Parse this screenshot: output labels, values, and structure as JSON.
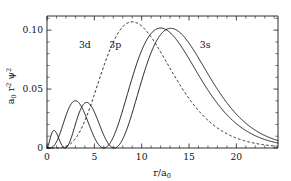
{
  "chart_data": {
    "type": "line",
    "title": "",
    "xlabel": "r/a_0",
    "ylabel": "a_0 r^2 psi^2",
    "xlim": [
      0,
      24.4
    ],
    "ylim": [
      0,
      0.112
    ],
    "grid": false,
    "legend_position": "inline-annotations",
    "x_ticks": [
      0,
      5,
      10,
      15,
      20
    ],
    "x_tick_labels": [
      "0",
      "5",
      "10",
      "15",
      "20"
    ],
    "x_minor_tick_step": 1,
    "y_ticks": [
      0,
      0.05,
      0.1
    ],
    "y_tick_labels": [
      "0",
      "0.05",
      "0.10"
    ],
    "y_minor_tick_step": 0.01,
    "annotations": [
      {
        "text": "3d",
        "x": 4.0,
        "y": 0.0845,
        "style": "dashed-series-label"
      },
      {
        "text": "3p",
        "x": 7.2,
        "y": 0.0845,
        "style": "solid-series-label"
      },
      {
        "text": "3s",
        "x": 16.7,
        "y": 0.0845,
        "style": "solid-series-label"
      }
    ],
    "series": [
      {
        "name": "3s",
        "label": "3s",
        "linestyle": "solid",
        "color": "#111111",
        "nodes_r": [
          1.9,
          7.1
        ],
        "peaks": [
          {
            "r": 0.74,
            "value": 0.0122
          },
          {
            "r": 4.2,
            "value": 0.0385
          },
          {
            "r": 13.1,
            "value": 0.1022
          }
        ],
        "formula": "R30 = (2/(81*sqrt(3)))*(27 - 18*r + 2*r*r)*exp(-r/3); y = r*r*R30*R30"
      },
      {
        "name": "3p",
        "label": "3p",
        "linestyle": "solid",
        "color": "#111111",
        "nodes_r": [
          6.0
        ],
        "peaks": [
          {
            "r": 2.95,
            "value": 0.0392
          },
          {
            "r": 12.0,
            "value": 0.1025
          }
        ],
        "formula": "R31 = (4/(81*sqrt(6)))*(6*r - r*r)*exp(-r/3); y = r*r*R31*R31"
      },
      {
        "name": "3d",
        "label": "3d",
        "linestyle": "dashed",
        "color": "#111111",
        "nodes_r": [],
        "peaks": [
          {
            "r": 9.0,
            "value": 0.1055
          }
        ],
        "formula": "R32 = (4/(81*sqrt(30)))*r*r*exp(-r/3); y = r*r*R32*R32"
      }
    ]
  },
  "axes": {
    "x_axis_title": "r/a",
    "x_axis_title_sub": "0",
    "y_axis_title_a": "a",
    "y_axis_title_a_sub": "0",
    "y_axis_title_r": "r",
    "y_axis_title_r_sup": "2",
    "y_axis_title_psi": "ψ",
    "y_axis_title_psi_sup": "2"
  }
}
